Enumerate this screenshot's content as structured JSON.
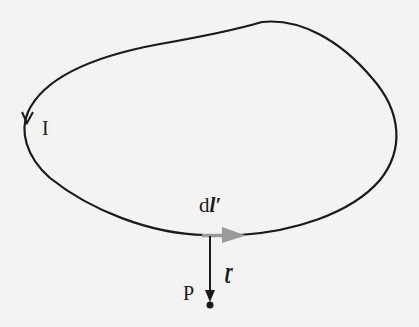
{
  "diagram": {
    "labels": {
      "current": "I",
      "line_element_d": "d",
      "line_element_l": "l′",
      "separation_vector": "ɽ",
      "field_point": "P"
    },
    "colors": {
      "background": "#f3f3f1",
      "loop": "#1a1a1a",
      "line_element_arrow": "#9a9a9a",
      "separation_vector": "#1a1a1a"
    },
    "elements": [
      {
        "name": "current-loop",
        "type": "closed-curve",
        "direction": "counterclockwise"
      },
      {
        "name": "current-direction-arrow",
        "position": "left side of loop",
        "points": "down"
      },
      {
        "name": "line-element-arrow",
        "position": "bottom of loop",
        "points": "right",
        "label": "dl′"
      },
      {
        "name": "separation-vector",
        "from": "line element",
        "to": "P",
        "label": "ɽ"
      },
      {
        "name": "field-point",
        "label": "P"
      }
    ]
  }
}
